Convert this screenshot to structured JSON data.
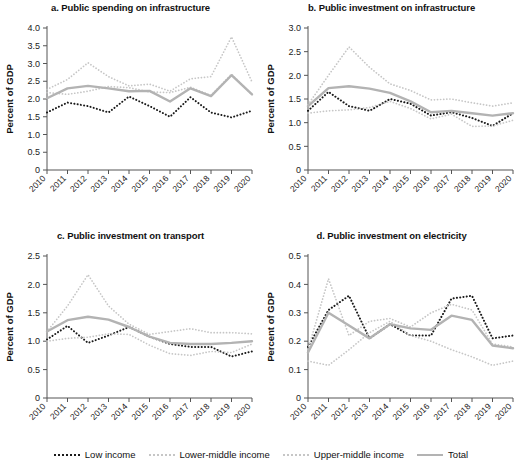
{
  "figure": {
    "width": 522,
    "height": 469,
    "ylabel": "Percent of GDP",
    "years": [
      "2010",
      "2011",
      "2012",
      "2013",
      "2014",
      "2015",
      "2016",
      "2017",
      "2018",
      "2019",
      "2020"
    ]
  },
  "legend": {
    "position": "bottom-center",
    "items": [
      {
        "label": "Low income",
        "style": "dotted",
        "color": "#1a1a1a",
        "name": "low-income"
      },
      {
        "label": "Lower-middle income",
        "style": "dotted",
        "color": "#c6c6c6",
        "name": "lower-middle-income"
      },
      {
        "label": "Upper-middle income",
        "style": "dotted",
        "color": "#c6c6c6",
        "name": "upper-middle-income"
      },
      {
        "label": "Total",
        "style": "solid",
        "color": "#b3b3b3",
        "name": "total"
      }
    ]
  },
  "chart_data": [
    {
      "id": "a",
      "type": "line",
      "title": "a. Public spending on infrastructure",
      "xlabel": "",
      "ylabel": "Percent of GDP",
      "x": [
        "2010",
        "2011",
        "2012",
        "2013",
        "2014",
        "2015",
        "2016",
        "2017",
        "2018",
        "2019",
        "2020"
      ],
      "ylim": [
        0,
        4.0
      ],
      "yticks": [
        "0",
        "0.5",
        "1.0",
        "1.5",
        "2.0",
        "2.5",
        "3.0",
        "3.5",
        "4.0"
      ],
      "ytickvals": [
        0,
        0.5,
        1.0,
        1.5,
        2.0,
        2.5,
        3.0,
        3.5,
        4.0
      ],
      "grid": false,
      "series": [
        {
          "name": "Low income",
          "color": "#1a1a1a",
          "style": "dotted",
          "values": [
            1.62,
            1.9,
            1.8,
            1.62,
            2.07,
            1.8,
            1.5,
            2.05,
            1.62,
            1.48,
            1.67
          ]
        },
        {
          "name": "Lower-middle income",
          "color": "#c6c6c6",
          "style": "dotted",
          "values": [
            2.18,
            2.13,
            2.22,
            2.35,
            2.32,
            2.2,
            2.18,
            2.33,
            2.1,
            2.7,
            2.12
          ]
        },
        {
          "name": "Upper-middle income",
          "color": "#c6c6c6",
          "style": "dotted",
          "values": [
            2.27,
            2.55,
            3.02,
            2.63,
            2.37,
            2.42,
            2.22,
            2.57,
            2.63,
            3.75,
            2.48
          ]
        },
        {
          "name": "Total",
          "color": "#b3b3b3",
          "style": "solid",
          "values": [
            2.02,
            2.3,
            2.37,
            2.3,
            2.22,
            2.23,
            1.93,
            2.3,
            2.08,
            2.67,
            2.13
          ]
        }
      ]
    },
    {
      "id": "b",
      "type": "line",
      "title": "b. Public investment on infrastructure",
      "xlabel": "",
      "ylabel": "Percent of GDP",
      "x": [
        "2010",
        "2011",
        "2012",
        "2013",
        "2014",
        "2015",
        "2016",
        "2017",
        "2018",
        "2019",
        "2020"
      ],
      "ylim": [
        0,
        3.0
      ],
      "yticks": [
        "0",
        "0.5",
        "1.0",
        "1.5",
        "2.0",
        "2.5",
        "3.0"
      ],
      "ytickvals": [
        0,
        0.5,
        1.0,
        1.5,
        2.0,
        2.5,
        3.0
      ],
      "grid": false,
      "series": [
        {
          "name": "Low income",
          "color": "#1a1a1a",
          "style": "dotted",
          "values": [
            1.25,
            1.65,
            1.35,
            1.25,
            1.5,
            1.4,
            1.15,
            1.22,
            1.1,
            0.93,
            1.2
          ]
        },
        {
          "name": "Lower-middle income",
          "color": "#c6c6c6",
          "style": "dotted",
          "values": [
            1.2,
            1.25,
            1.27,
            1.32,
            1.45,
            1.3,
            1.08,
            1.18,
            0.92,
            0.93,
            1.05
          ]
        },
        {
          "name": "Upper-middle income",
          "color": "#c6c6c6",
          "style": "dotted",
          "values": [
            1.38,
            2.0,
            2.6,
            2.17,
            1.82,
            1.68,
            1.48,
            1.5,
            1.42,
            1.35,
            1.42
          ]
        },
        {
          "name": "Total",
          "color": "#b3b3b3",
          "style": "solid",
          "values": [
            1.35,
            1.73,
            1.77,
            1.72,
            1.63,
            1.45,
            1.22,
            1.25,
            1.2,
            1.15,
            1.2
          ]
        }
      ]
    },
    {
      "id": "c",
      "type": "line",
      "title": "c. Public investment on transport",
      "xlabel": "",
      "ylabel": "Percent of GDP",
      "x": [
        "2010",
        "2011",
        "2012",
        "2013",
        "2014",
        "2015",
        "2016",
        "2017",
        "2018",
        "2019",
        "2020"
      ],
      "ylim": [
        0,
        2.5
      ],
      "yticks": [
        "0",
        "0.5",
        "1.0",
        "1.5",
        "2.0",
        "2.5"
      ],
      "ytickvals": [
        0,
        0.5,
        1.0,
        1.5,
        2.0,
        2.5
      ],
      "grid": false,
      "series": [
        {
          "name": "Low income",
          "color": "#1a1a1a",
          "style": "dotted",
          "values": [
            1.03,
            1.27,
            0.97,
            1.1,
            1.25,
            1.08,
            0.95,
            0.9,
            0.9,
            0.73,
            0.82
          ]
        },
        {
          "name": "Lower-middle income",
          "color": "#c6c6c6",
          "style": "dotted",
          "values": [
            1.0,
            1.05,
            1.07,
            1.13,
            1.12,
            0.93,
            0.78,
            0.75,
            0.82,
            0.8,
            0.95
          ]
        },
        {
          "name": "Upper-middle income",
          "color": "#c6c6c6",
          "style": "dotted",
          "values": [
            1.17,
            1.62,
            2.17,
            1.62,
            1.3,
            1.12,
            1.17,
            1.22,
            1.15,
            1.15,
            1.13
          ]
        },
        {
          "name": "Total",
          "color": "#b3b3b3",
          "style": "solid",
          "values": [
            1.17,
            1.37,
            1.43,
            1.38,
            1.25,
            1.08,
            0.97,
            0.95,
            0.95,
            0.97,
            1.0
          ]
        }
      ]
    },
    {
      "id": "d",
      "type": "line",
      "title": "d. Public investment on electricity",
      "xlabel": "",
      "ylabel": "Percent of GDP",
      "x": [
        "2010",
        "2011",
        "2012",
        "2013",
        "2014",
        "2015",
        "2016",
        "2017",
        "2018",
        "2019",
        "2020"
      ],
      "ylim": [
        0,
        0.5
      ],
      "yticks": [
        "0",
        "0.1",
        "0.2",
        "0.3",
        "0.4",
        "0.5"
      ],
      "ytickvals": [
        0,
        0.1,
        0.2,
        0.3,
        0.4,
        0.5
      ],
      "grid": false,
      "series": [
        {
          "name": "Low income",
          "color": "#1a1a1a",
          "style": "dotted",
          "values": [
            0.18,
            0.31,
            0.36,
            0.21,
            0.26,
            0.22,
            0.22,
            0.35,
            0.36,
            0.21,
            0.22
          ]
        },
        {
          "name": "Lower-middle income",
          "color": "#c6c6c6",
          "style": "dotted",
          "values": [
            0.13,
            0.115,
            0.17,
            0.23,
            0.27,
            0.22,
            0.2,
            0.17,
            0.145,
            0.115,
            0.13
          ]
        },
        {
          "name": "Upper-middle income",
          "color": "#c6c6c6",
          "style": "dotted",
          "values": [
            0.17,
            0.42,
            0.22,
            0.27,
            0.28,
            0.25,
            0.3,
            0.33,
            0.31,
            0.19,
            0.18
          ]
        },
        {
          "name": "Total",
          "color": "#b3b3b3",
          "style": "solid",
          "values": [
            0.16,
            0.3,
            0.255,
            0.21,
            0.26,
            0.245,
            0.24,
            0.29,
            0.275,
            0.185,
            0.175
          ]
        }
      ]
    }
  ]
}
